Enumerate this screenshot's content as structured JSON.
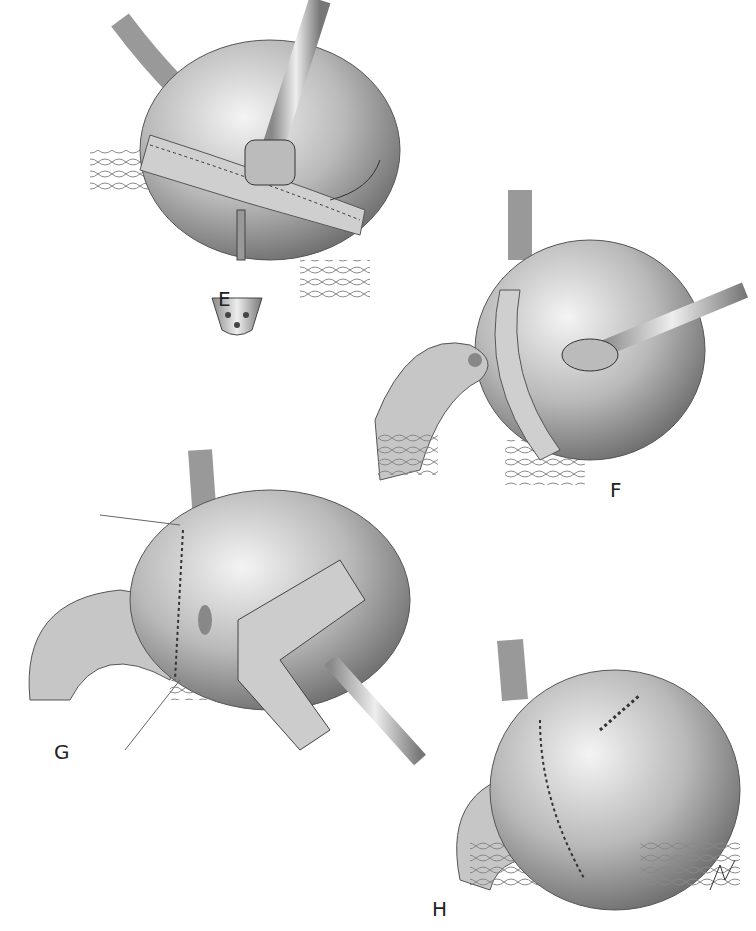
{
  "figure": {
    "panels": [
      {
        "id": "E",
        "label": "E"
      },
      {
        "id": "F",
        "label": "F"
      },
      {
        "id": "G",
        "label": "G"
      },
      {
        "id": "H",
        "label": "H"
      }
    ]
  }
}
